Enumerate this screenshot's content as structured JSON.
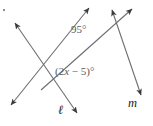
{
  "figure": {
    "type": "geometry-diagram",
    "background_color": "#ffffff",
    "line_color": "#6d6e71",
    "label_color": "#58595b",
    "line_label_color": "#1d1d1b",
    "angles": [
      {
        "name": "upper-angle",
        "text": "95°",
        "value": 95,
        "unit": "degrees",
        "position": {
          "x": 71,
          "y": 24
        }
      },
      {
        "name": "lower-angle",
        "text_prefix": "(2",
        "text_var": "x",
        "text_suffix": " − 5)°",
        "expression": "(2x - 5)°",
        "position": {
          "x": 55,
          "y": 66
        }
      }
    ],
    "line_labels": [
      {
        "name": "line-ell",
        "text": "ℓ",
        "position": {
          "x": 58,
          "y": 104
        }
      },
      {
        "name": "line-m",
        "text": "m",
        "position": {
          "x": 128,
          "y": 97
        }
      }
    ],
    "lines": [
      {
        "name": "line-ell-segment",
        "x1": 14,
        "y1": 22,
        "x2": 78,
        "y2": 114,
        "arrow_start": true,
        "arrow_end": true
      },
      {
        "name": "line-m-segment",
        "x1": 133,
        "y1": 8,
        "x2": 140,
        "y2": 96,
        "arrow_start": true,
        "arrow_end": true
      },
      {
        "name": "transversal-upper",
        "x1": 88,
        "y1": 7,
        "x2": 10,
        "y2": 106,
        "arrow_start": true,
        "arrow_end": true
      },
      {
        "name": "transversal-lower",
        "x1": 140,
        "y1": 96,
        "x2": 88,
        "y2": 7,
        "arrow_start": false,
        "arrow_end": false
      }
    ],
    "intersections": [
      {
        "name": "upper-intersection",
        "x": 103,
        "y": 35
      },
      {
        "name": "lower-intersection",
        "x": 57,
        "y": 72
      }
    ]
  }
}
